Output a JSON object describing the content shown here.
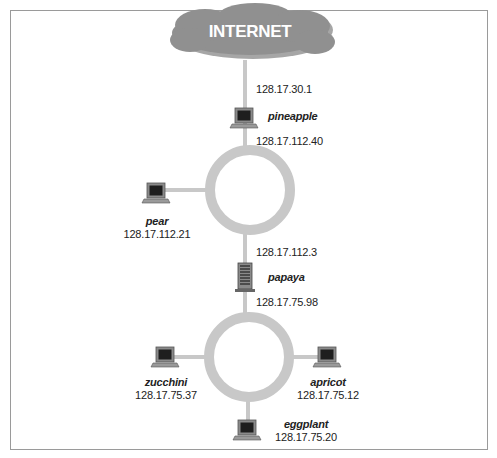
{
  "diagram": {
    "type": "network-topology",
    "cloud": {
      "label": "INTERNET"
    },
    "nodes": [
      {
        "id": "pineapple",
        "name": "pineapple",
        "kind": "workstation",
        "ips": [
          "128.17.30.1",
          "128.17.112.40"
        ],
        "role": "gateway"
      },
      {
        "id": "pear",
        "name": "pear",
        "kind": "workstation",
        "ips": [
          "128.17.112.21"
        ]
      },
      {
        "id": "papaya",
        "name": "papaya",
        "kind": "server",
        "ips": [
          "128.17.112.3",
          "128.17.75.98"
        ],
        "role": "router"
      },
      {
        "id": "zucchini",
        "name": "zucchini",
        "kind": "workstation",
        "ips": [
          "128.17.75.37"
        ]
      },
      {
        "id": "apricot",
        "name": "apricot",
        "kind": "workstation",
        "ips": [
          "128.17.75.12"
        ]
      },
      {
        "id": "eggplant",
        "name": "eggplant",
        "kind": "workstation",
        "ips": [
          "128.17.75.20"
        ]
      }
    ],
    "networks": [
      {
        "id": "ring-upper",
        "members": [
          "pineapple",
          "pear",
          "papaya"
        ]
      },
      {
        "id": "ring-lower",
        "members": [
          "papaya",
          "zucchini",
          "apricot",
          "eggplant"
        ]
      }
    ],
    "links": [
      [
        "INTERNET",
        "pineapple"
      ],
      [
        "pineapple",
        "ring-upper"
      ],
      [
        "pear",
        "ring-upper"
      ],
      [
        "ring-upper",
        "papaya"
      ],
      [
        "papaya",
        "ring-lower"
      ],
      [
        "zucchini",
        "ring-lower"
      ],
      [
        "apricot",
        "ring-lower"
      ],
      [
        "eggplant",
        "ring-lower"
      ]
    ],
    "colors": {
      "ring": "#c8c8c8",
      "cloud": "#8f8f8f",
      "frame": "#9a9a9a"
    }
  },
  "labels": {
    "pineapple_ip_top": "128.17.30.1",
    "pineapple_name": "pineapple",
    "pineapple_ip_bottom": "128.17.112.40",
    "pear_name": "pear",
    "pear_ip": "128.17.112.21",
    "papaya_ip_top": "128.17.112.3",
    "papaya_name": "papaya",
    "papaya_ip_bottom": "128.17.75.98",
    "zucchini_name": "zucchini",
    "zucchini_ip": "128.17.75.37",
    "apricot_name": "apricot",
    "apricot_ip": "128.17.75.12",
    "eggplant_name": "eggplant",
    "eggplant_ip": "128.17.75.20"
  }
}
